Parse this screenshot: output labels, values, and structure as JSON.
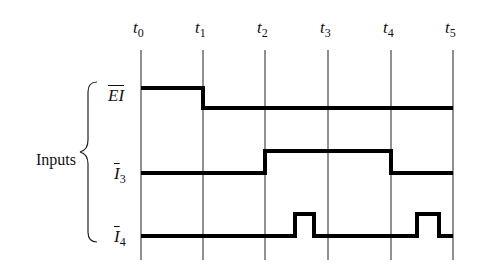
{
  "diagram": {
    "type": "timing-diagram",
    "group_label": "Inputs",
    "time_markers": [
      {
        "label": "t",
        "sub": "0",
        "x": 141
      },
      {
        "label": "t",
        "sub": "1",
        "x": 203
      },
      {
        "label": "t",
        "sub": "2",
        "x": 265
      },
      {
        "label": "t",
        "sub": "3",
        "x": 328
      },
      {
        "label": "t",
        "sub": "4",
        "x": 391
      },
      {
        "label": "t",
        "sub": "5",
        "x": 453
      }
    ],
    "signals": [
      {
        "name": "EI",
        "overbar": true,
        "sub": "",
        "points": "141,88 203,88 203,108 453,108"
      },
      {
        "name": "I",
        "overbar": true,
        "sub": "3",
        "points": "141,173 265,173 265,151 391,151 391,173 453,173"
      },
      {
        "name": "I",
        "overbar": true,
        "sub": "4",
        "points": "141,236 295,236 295,214 314,214 314,236 417,236 417,214 439,214 439,236 453,236"
      }
    ],
    "colors": {
      "line": "#000000",
      "background": "#ffffff"
    }
  }
}
